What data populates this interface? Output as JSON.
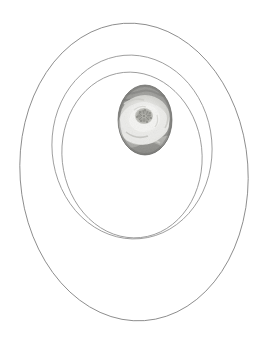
{
  "canvas": {
    "width": 264,
    "height": 342,
    "background_color": "#ffffff",
    "title": "Concentric oval frame with flower vignette"
  },
  "style": {
    "stroke_color": "#808080",
    "stroke_color_inner": "#8a8a8a",
    "stroke_width": 0.8,
    "fill": "none"
  },
  "ellipses": [
    {
      "name": "outer-ellipse",
      "cx": 134,
      "cy": 172,
      "rx": 114,
      "ry": 149,
      "rotation": -4,
      "stroke": "#7d7d7d",
      "stroke_width": 0.85
    },
    {
      "name": "middle-ellipse",
      "cx": 132,
      "cy": 147,
      "rx": 80,
      "ry": 92,
      "rotation": -5,
      "stroke": "#8a8a8a",
      "stroke_width": 0.8
    },
    {
      "name": "inner-ellipse",
      "cx": 132,
      "cy": 155,
      "rx": 70,
      "ry": 83,
      "rotation": -6,
      "stroke": "#8a8a8a",
      "stroke_width": 0.8
    }
  ],
  "photo": {
    "name": "flower-oval-photo",
    "subject": "flower-bloom",
    "description": "Grayscale photograph of a pale open flower bloom with a dense cluster of stamens at the centre, set against a darker mottled background, masked into an upright oval.",
    "color_mode": "grayscale",
    "cx": 145,
    "cy": 120,
    "rx": 27,
    "ry": 35,
    "tones": {
      "background_dark": "#7a7a7a",
      "background_mid": "#9a9a9a",
      "petal_light": "#e8e8e6",
      "petal_mid": "#cfcfcc",
      "stamen_dark": "#8e8e8a",
      "shadow": "#6e6e6e",
      "lower_leaf": "#a8a8a4"
    }
  }
}
